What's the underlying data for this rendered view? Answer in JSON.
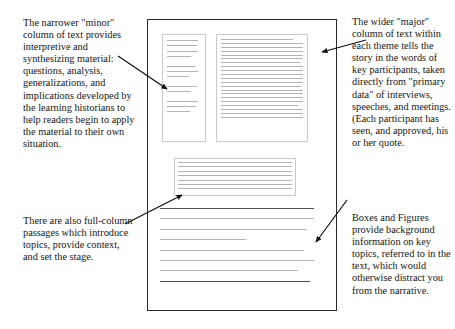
{
  "figure": {
    "type": "annotated-diagram"
  },
  "captions": {
    "minor_column": "The narrower \"minor\" column of text provides interpretive and synthesizing material: questions, analysis, generalizations, and implications developed by the learning historians to help readers begin to apply the material to their own situation.",
    "full_column": "There are also full-column passages which introduce topics, provide context, and set the stage.",
    "major_column": "The wider \"major\" column of text within each theme tells the story in the words of key participants, taken directly from \"primary data\" of interviews, speeches, and meetings. (Each participant has seen, and approved, his or her quote.",
    "boxes_figures": "Boxes and Figures provide background information on key topics, referred to in the text, which would otherwise distract you from the narrative."
  },
  "page_mock": {
    "minor_column": {
      "name": "minor-column",
      "line_widths": [
        "92%",
        "88%",
        "90%",
        "72%",
        "0",
        "86%",
        "90%",
        "64%",
        "0",
        "88%",
        "70%",
        "0",
        "90%",
        "86%",
        "68%"
      ]
    },
    "major_column": {
      "name": "major-column",
      "line_widths": [
        "88%",
        "100%",
        "100%",
        "100%",
        "100%",
        "100%",
        "96%",
        "100%",
        "100%",
        "100%",
        "100%",
        "100%",
        "98%",
        "100%",
        "100%",
        "100%",
        "100%",
        "94%",
        "100%",
        "100%",
        "100%"
      ]
    },
    "figure_box": {
      "name": "figure-box",
      "line_widths": [
        "100%",
        "100%",
        "100%",
        "100%",
        "100%",
        "100%",
        "100%"
      ]
    },
    "full_column": {
      "name": "full-column-passage",
      "line_widths": [
        "96%",
        "96%",
        "92%",
        "54%",
        "90%",
        "96%",
        "86%",
        "94%"
      ]
    }
  },
  "arrows": {
    "minor_column_pointer": "arrow-to-minor-column",
    "full_column_pointer": "arrow-to-figure-box",
    "major_column_pointer": "arrow-to-major-column",
    "boxes_figures_pointer": "arrow-to-full-column"
  },
  "colors": {
    "page_border": "#2b2b2b",
    "column_border": "#c9c9c9",
    "rule_light": "#b4b4b4",
    "rule_dark": "#4d4d4d",
    "text": "#151515",
    "arrow": "#111111",
    "background": "#ffffff"
  }
}
